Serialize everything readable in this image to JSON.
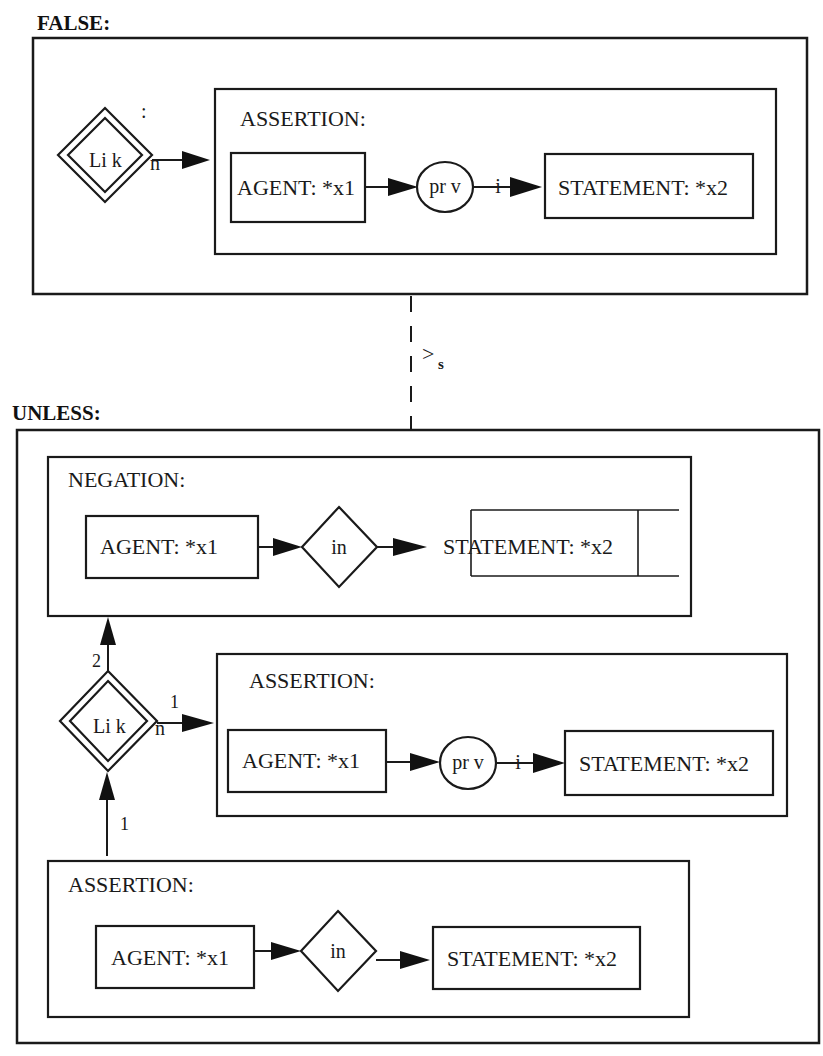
{
  "diagram": {
    "false_section": {
      "title": "FALSE:",
      "link_node": {
        "label_left": "Li k",
        "label_right": "n",
        "top_mark": ":"
      },
      "assertion": {
        "title": "ASSERTION:",
        "agent": "AGENT: *x1",
        "relation": "pr v",
        "relation_tail": "i",
        "statement": "STATEMENT: *x2"
      }
    },
    "connector": {
      "label": ">",
      "subscript": "s"
    },
    "unless_section": {
      "title": "UNLESS:",
      "negation": {
        "title": "NEGATION:",
        "agent": "AGENT: *x1",
        "relation": "in",
        "statement": "STATEMENT: *x2"
      },
      "link_node": {
        "label_left": "Li k",
        "label_right": "n",
        "edge_up_label": "2",
        "edge_right_label": "1",
        "edge_bottom_label": "1"
      },
      "assertion_1": {
        "title": "ASSERTION:",
        "agent": "AGENT: *x1",
        "relation": "pr v",
        "relation_tail": "i",
        "statement": "STATEMENT: *x2"
      },
      "assertion_2": {
        "title": "ASSERTION:",
        "agent": "AGENT: *x1",
        "relation": "in",
        "statement": "STATEMENT: *x2"
      }
    }
  }
}
